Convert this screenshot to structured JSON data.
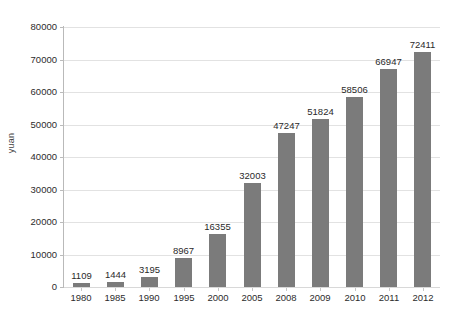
{
  "chart_data": {
    "type": "bar",
    "title": "",
    "subtitle": "",
    "xlabel": "",
    "ylabel": "yuan",
    "categories": [
      "1980",
      "1985",
      "1990",
      "1995",
      "2000",
      "2005",
      "2008",
      "2009",
      "2010",
      "2011",
      "2012"
    ],
    "values": [
      1109,
      1444,
      3195,
      8967,
      16355,
      32003,
      47247,
      51824,
      58506,
      66947,
      72411
    ],
    "data_labels": [
      "1109",
      "1444",
      "3195",
      "8967",
      "16355",
      "32003",
      "47247",
      "51824",
      "58506",
      "66947",
      "72411"
    ],
    "ylim": [
      0,
      80000
    ],
    "y_ticks": [
      0,
      10000,
      20000,
      30000,
      40000,
      50000,
      60000,
      70000,
      80000
    ],
    "y_tick_labels": [
      "0",
      "10000",
      "20000",
      "30000",
      "40000",
      "50000",
      "60000",
      "70000",
      "80000"
    ],
    "grid": true,
    "grid_axis": "y",
    "legend": false,
    "legend_position": "none",
    "bar_color": "#7b7b7b",
    "gridline_color": "#e2e2e2",
    "axis_color": "#bbbbbb",
    "text_color": "#2c2c2c",
    "background": "#ffffff"
  }
}
